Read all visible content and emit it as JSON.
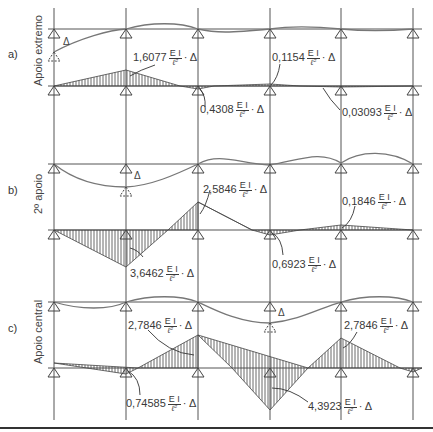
{
  "figure": {
    "supports_x": [
      54,
      126,
      198,
      270,
      341,
      413
    ],
    "line_color": "#555555",
    "curve_color": "#777777",
    "hatch_color": "#444444",
    "bottom_rule_color": "#333333",
    "fraction": {
      "numerator": "E I",
      "denominator": "ℓ²",
      "suffix": "· Δ"
    },
    "delta_symbol": "Δ"
  },
  "sections": [
    {
      "tag": "a)",
      "side_label": "Apoio extremo",
      "settled_support_index": 0,
      "labels": [
        {
          "value": "1,6077"
        },
        {
          "value": "0,4308"
        },
        {
          "value": "0,1154"
        },
        {
          "value": "0,03093"
        }
      ]
    },
    {
      "tag": "b)",
      "side_label": "2º apoio",
      "settled_support_index": 1,
      "labels": [
        {
          "value": "3,6462"
        },
        {
          "value": "2,5846"
        },
        {
          "value": "0,6923"
        },
        {
          "value": "0,1846"
        }
      ]
    },
    {
      "tag": "c)",
      "side_label": "Apoio central",
      "settled_support_index": 2,
      "labels": [
        {
          "value": "0,74585"
        },
        {
          "value": "2,7846"
        },
        {
          "value": "4,3923"
        },
        {
          "value": "2,7846"
        }
      ]
    }
  ]
}
